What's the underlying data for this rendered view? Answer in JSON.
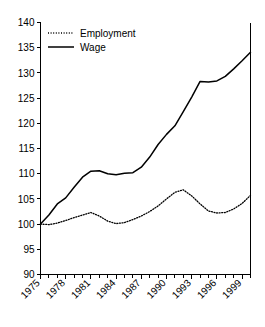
{
  "chart_data": {
    "type": "line",
    "title": "",
    "subtitle": "",
    "xlabel": "",
    "ylabel": "",
    "xlim": [
      1975,
      2000
    ],
    "ylim": [
      90,
      140
    ],
    "grid": false,
    "legend_position": "top-left",
    "x": [
      1975,
      1976,
      1977,
      1978,
      1979,
      1980,
      1981,
      1982,
      1983,
      1984,
      1985,
      1986,
      1987,
      1988,
      1989,
      1990,
      1991,
      1992,
      1993,
      1994,
      1995,
      1996,
      1997,
      1998,
      1999,
      2000
    ],
    "xticklabels": [
      "1975",
      "1978",
      "1981",
      "1984",
      "1987",
      "1990",
      "1993",
      "1996",
      "1999"
    ],
    "xticks": [
      1975,
      1978,
      1981,
      1984,
      1987,
      1990,
      1993,
      1996,
      1999
    ],
    "yticks": [
      90,
      95,
      100,
      105,
      110,
      115,
      120,
      125,
      130,
      135,
      140
    ],
    "yticklabels": [
      "90",
      "95",
      "100",
      "105",
      "110",
      "115",
      "120",
      "125",
      "130",
      "135",
      "140"
    ],
    "series": [
      {
        "name": "Employment",
        "style": "dotted",
        "color": "#000000",
        "values": [
          100.0,
          99.9,
          100.2,
          100.7,
          101.3,
          101.8,
          102.3,
          101.6,
          100.6,
          100.1,
          100.3,
          100.9,
          101.6,
          102.5,
          103.6,
          105.0,
          106.3,
          106.8,
          105.6,
          104.0,
          102.6,
          102.2,
          102.3,
          103.0,
          104.1,
          105.7
        ]
      },
      {
        "name": "Wage",
        "style": "solid",
        "color": "#000000",
        "values": [
          100.0,
          101.8,
          104.0,
          105.2,
          107.3,
          109.3,
          110.5,
          110.6,
          110.0,
          109.8,
          110.1,
          110.2,
          111.3,
          113.3,
          115.8,
          117.8,
          119.5,
          122.3,
          125.2,
          128.3,
          128.2,
          128.4,
          129.3,
          130.8,
          132.4,
          134.1
        ]
      }
    ]
  },
  "legend": {
    "items": [
      {
        "label": "Employment"
      },
      {
        "label": "Wage"
      }
    ]
  },
  "axes": {
    "y_axis_name": "index-value-axis",
    "x_axis_name": "year-axis"
  }
}
